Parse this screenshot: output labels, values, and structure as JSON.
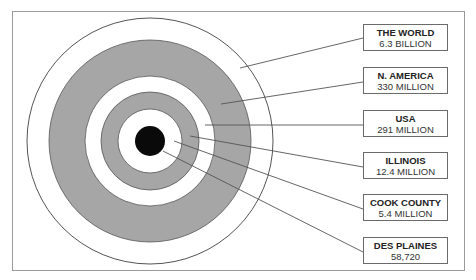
{
  "diagram": {
    "type": "concentric-target",
    "colors": {
      "ring_gray": "#a6a6a6",
      "center": "#0a0a0a",
      "line": "#555555",
      "background": "#ffffff"
    },
    "levels": [
      {
        "name": "THE WORLD",
        "value": "6.3 BILLION"
      },
      {
        "name": "N. AMERICA",
        "value": "330 MILLION"
      },
      {
        "name": "USA",
        "value": "291 MILLION"
      },
      {
        "name": "ILLINOIS",
        "value": "12.4 MILLION"
      },
      {
        "name": "COOK COUNTY",
        "value": "5.4 MILLION"
      },
      {
        "name": "DES PLAINES",
        "value": "58,720"
      }
    ]
  }
}
